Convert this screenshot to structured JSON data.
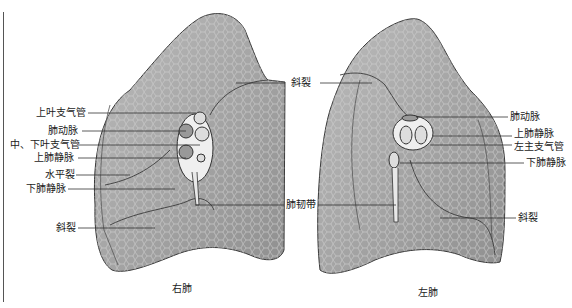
{
  "figure": {
    "right_lung": {
      "caption": "右肺",
      "labels": {
        "upper_lobe_bronchus": "上叶支气管",
        "pulmonary_artery": "肺动脉",
        "middle_lower_lobe_bronchus": "中、下叶支气管",
        "superior_pulmonary_vein": "上肺静脉",
        "horizontal_fissure": "水平裂",
        "inferior_pulmonary_vein": "下肺静脉",
        "oblique_fissure": "斜裂"
      }
    },
    "center_labels": {
      "oblique_fissure": "斜裂",
      "pulmonary_ligament": "肺韧带"
    },
    "left_lung": {
      "caption": "左肺",
      "labels": {
        "pulmonary_artery": "肺动脉",
        "superior_pulmonary_vein": "上肺静脉",
        "left_main_bronchus": "左主支气管",
        "inferior_pulmonary_vein": "下肺静脉",
        "oblique_fissure": "斜裂"
      }
    },
    "colors": {
      "lung_fill": "#a9a9a9",
      "lung_dark": "#7d7d7d",
      "lung_light": "#c8c8c8",
      "outline": "#3a3a3a",
      "leader_line": "#333333"
    }
  }
}
